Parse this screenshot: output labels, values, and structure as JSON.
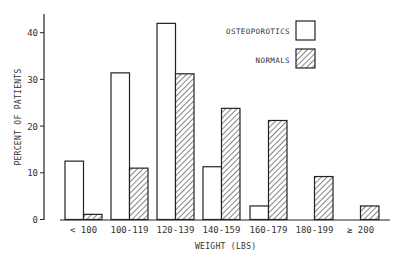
{
  "chart_data": {
    "type": "bar",
    "title": "",
    "xlabel": "WEIGHT (LBS)",
    "ylabel": "PERCENT OF PATIENTS",
    "ylim": [
      0,
      45
    ],
    "yticks": [
      0,
      10,
      20,
      30,
      40
    ],
    "grid": false,
    "legend_position": "upper right",
    "categories": [
      "< 100",
      "100-119",
      "120-139",
      "140-159",
      "160-179",
      "180-199",
      "≥ 200"
    ],
    "series": [
      {
        "name": "OSTEOPOROTICS",
        "pattern": "open",
        "values": [
          12.5,
          31.4,
          42.0,
          11.3,
          2.9,
          0,
          0
        ]
      },
      {
        "name": "NORMALS",
        "pattern": "hatched",
        "values": [
          1.1,
          11.0,
          31.2,
          23.8,
          21.2,
          9.2,
          2.9
        ]
      }
    ]
  },
  "labels": {
    "ylabel": "PERCENT OF PATIENTS",
    "xlabel": "WEIGHT (LBS)",
    "legend_osteo": "OSTEOPOROTICS",
    "legend_normal": "NORMALS",
    "yticks": [
      "0",
      "10",
      "20",
      "30",
      "40"
    ],
    "categories": [
      "< 100",
      "100-119",
      "120-139",
      "140-159",
      "160-179",
      "180-199",
      "≥ 200"
    ]
  },
  "colors": {
    "stroke": "#222222",
    "fill_open": "#ffffff",
    "hatch": "#333333"
  }
}
